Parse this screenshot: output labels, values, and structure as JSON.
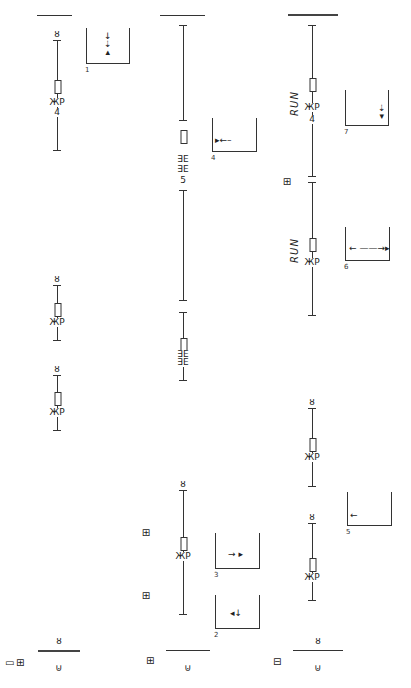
{
  "diagram": {
    "type": "movement-notation-score",
    "columns": [
      {
        "id": "col-1",
        "x": 57,
        "top_bar": {
          "x1": 37,
          "x2": 72,
          "y": 15,
          "thick": false
        },
        "staves": [
          {
            "y1": 40,
            "y2": 150,
            "top_symbol": "ȣ",
            "hold_y": 80,
            "sign": "ЖP",
            "sign_y": 98,
            "digit": "4",
            "digit_y": 108
          },
          {
            "y1": 285,
            "y2": 340,
            "top_symbol": "ȣ",
            "hold_y": 303,
            "sign": "ЖP",
            "sign_y": 318
          },
          {
            "y1": 375,
            "y2": 430,
            "top_symbol": "ȣ",
            "hold_y": 392,
            "sign": "ЖP",
            "sign_y": 408
          }
        ],
        "bottom": {
          "top_symbol": "ȣ",
          "bar_y": 650,
          "bar_x1": 38,
          "bar_x2": 80,
          "pin": "⊍",
          "pin_y": 662,
          "icons": [
            "▭",
            "⊞"
          ],
          "icons_x": [
            5,
            16
          ],
          "icons_y": 658
        }
      },
      {
        "id": "col-2",
        "x": 183,
        "top_bar": {
          "x1": 160,
          "x2": 205,
          "y": 15,
          "thick": false
        },
        "staves": [
          {
            "y1": 25,
            "y2": 120,
            "top_symbol": "",
            "hold_y": 130,
            "tally_lines": [
              "∃Ε",
              "∃Ε"
            ],
            "tally_y": [
              155,
              165
            ],
            "digit": "5",
            "digit_y": 176
          },
          {
            "y1": 190,
            "y2": 300,
            "top_symbol": ""
          },
          {
            "y1": 312,
            "y2": 380,
            "top_symbol": "",
            "hold_y": 338,
            "tally_lines": [
              "∃Ε",
              "∃Ε"
            ],
            "tally_y": [
              350,
              358
            ]
          },
          {
            "y1": 490,
            "y2": 614,
            "top_symbol": "ȣ",
            "hold_y": 537,
            "sign": "ЖP",
            "sign_y": 552
          }
        ],
        "side_icons": [
          {
            "glyph": "⊞",
            "x": 146,
            "y": 528
          },
          {
            "glyph": "⊞",
            "x": 146,
            "y": 591
          }
        ],
        "bottom": {
          "top_symbol": "",
          "bar_y": 650,
          "bar_x1": 166,
          "bar_x2": 210,
          "pin": "⊍",
          "pin_y": 662,
          "icons": [
            "⊞"
          ],
          "icons_x": [
            146
          ],
          "icons_y": 656
        }
      },
      {
        "id": "col-3",
        "x": 312,
        "top_bar": {
          "x1": 288,
          "x2": 338,
          "y": 14,
          "thick": true
        },
        "staves": [
          {
            "y1": 25,
            "y2": 176,
            "top_symbol": "",
            "hold_y": 78,
            "sign": "ЖP",
            "sign_y": 103,
            "digit": "4",
            "digit_y": 115,
            "run": "RUN",
            "run_y": 98
          },
          {
            "y1": 182,
            "y2": 315,
            "top_symbol": "",
            "hold_y": 238,
            "sign": "ЖP",
            "sign_y": 258,
            "run": "RUN",
            "run_y": 245
          },
          {
            "y1": 408,
            "y2": 486,
            "top_symbol": "ȣ",
            "hold_y": 438,
            "sign": "ЖP",
            "sign_y": 453
          },
          {
            "y1": 523,
            "y2": 600,
            "top_symbol": "ȣ",
            "hold_y": 558,
            "sign": "ЖP",
            "sign_y": 573
          }
        ],
        "side_icons": [
          {
            "glyph": "⊞",
            "x": 287,
            "y": 177
          }
        ],
        "bottom": {
          "top_symbol": "ȣ",
          "bar_y": 650,
          "bar_x1": 293,
          "bar_x2": 343,
          "pin": "⊍",
          "pin_y": 662,
          "icons": [
            "⊟"
          ],
          "icons_x": [
            273
          ],
          "icons_y": 657
        }
      }
    ],
    "figures": [
      {
        "label": "1",
        "x": 86,
        "y": 28,
        "w": 42,
        "h": 35,
        "arrows": "↓\n⇣\n▴",
        "arrow_x": 104,
        "arrow_y": 32,
        "vertical": true
      },
      {
        "label": "4",
        "x": 212,
        "y": 118,
        "w": 43,
        "h": 33,
        "arrows": "▸←–",
        "arrow_x": 215,
        "arrow_y": 136
      },
      {
        "label": "7",
        "x": 345,
        "y": 90,
        "w": 42,
        "h": 35,
        "arrows": "⇣\n▾",
        "arrow_x": 378,
        "arrow_y": 104,
        "vertical": true
      },
      {
        "label": "6",
        "x": 345,
        "y": 227,
        "w": 43,
        "h": 33,
        "arrows": "←  ——→▸",
        "arrow_x": 349,
        "arrow_y": 244
      },
      {
        "label": "5",
        "x": 347,
        "y": 492,
        "w": 43,
        "h": 33,
        "arrows": "←",
        "arrow_x": 350,
        "arrow_y": 511
      },
      {
        "label": "3",
        "x": 215,
        "y": 533,
        "w": 43,
        "h": 35,
        "arrows": "→ ▸",
        "arrow_x": 228,
        "arrow_y": 550
      },
      {
        "label": "2",
        "x": 215,
        "y": 595,
        "w": 43,
        "h": 33,
        "arrows": "◂↓",
        "arrow_x": 230,
        "arrow_y": 609
      }
    ]
  },
  "labels": {
    "run": "RUN",
    "figure_numbers": [
      "1",
      "2",
      "3",
      "4",
      "5",
      "6",
      "7"
    ]
  }
}
